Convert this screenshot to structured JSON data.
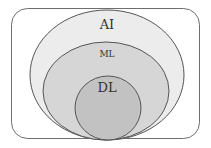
{
  "diagram": {
    "type": "nested-venn",
    "colors": {
      "background": "#ffffff",
      "frame_stroke": "#6e6e6e",
      "ai_fill": "#ececec",
      "ml_fill": "#d6d6d6",
      "dl_fill": "#c2c2c2",
      "stroke": "#555555",
      "text": "#333333"
    },
    "sets": [
      {
        "id": "ai",
        "label": "AI"
      },
      {
        "id": "ml",
        "label": "ML"
      },
      {
        "id": "dl",
        "label": "DL"
      }
    ]
  }
}
